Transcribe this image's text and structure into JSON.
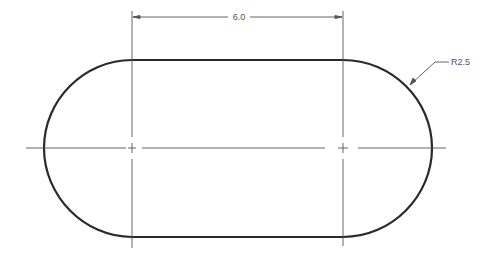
{
  "drawing": {
    "title": "Slot / obround technical drawing",
    "colors": {
      "outline": "#2a2a2a",
      "center_line": "#555555",
      "dimension": "#555555",
      "background": "#ffffff"
    },
    "dimensions": {
      "length_label": "6.0",
      "radius_label": "R2.5"
    },
    "geometry": {
      "left_center_x": 132,
      "right_center_x": 343,
      "center_y": 148,
      "top_y": 60,
      "bottom_y": 237,
      "left_extreme_x": 44,
      "right_extreme_x": 432
    }
  }
}
